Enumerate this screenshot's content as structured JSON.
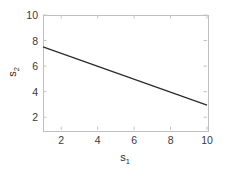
{
  "chart_data": {
    "type": "line",
    "title": "",
    "subtitle": "",
    "xlabel": "s",
    "xlabel_sub": "1",
    "ylabel": "s",
    "ylabel_sub": "2",
    "xlim": [
      1,
      10
    ],
    "ylim": [
      1,
      10
    ],
    "xticks": [
      2,
      4,
      6,
      8,
      10
    ],
    "xticklabels": [
      "2",
      "4",
      "6",
      "8",
      "10"
    ],
    "yticks": [
      2,
      4,
      6,
      8,
      10
    ],
    "yticklabels": [
      "2",
      "4",
      "6",
      "8",
      "10"
    ],
    "grid": false,
    "legend": null,
    "legend_position": "none",
    "annotations": [],
    "series": [
      {
        "name": "s2 vs s1",
        "color": "#2a2a2a",
        "linewidth": 1.2,
        "x": [
          1,
          10
        ],
        "y": [
          7.5,
          2.95
        ]
      }
    ],
    "colors": {
      "line": "#2a2a2a",
      "axes": "#bfbfbf",
      "ticks": "#c4c4c4",
      "text": "#3a3a3a",
      "background": "#ffffff"
    }
  },
  "figure": {
    "background": "#ffffff",
    "width": 228,
    "height": 179
  }
}
